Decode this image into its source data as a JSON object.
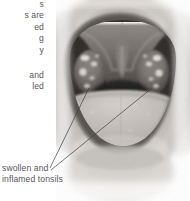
{
  "figure": {
    "style": "grayscale medical photograph illustration",
    "background_color": "#ffffff",
    "text_color": "#58585a",
    "leader_line_color": "#3f3f42"
  },
  "annotations": {
    "top_label": {
      "name": "upper-annotation-clipped",
      "lines": [
        "s",
        "s are",
        "ed",
        "g",
        "y"
      ],
      "text": "s\ns are\ned\ng\ny",
      "clipped": true,
      "align": "right"
    },
    "middle_label": {
      "name": "middle-annotation-clipped",
      "lines": [
        "and",
        "led"
      ],
      "text": "and\nled",
      "clipped": true,
      "align": "right"
    },
    "bottom_label": {
      "name": "tonsils-caption",
      "lines": [
        "swollen and",
        "inflamed tonsils"
      ],
      "text": "swollen and\ninflamed tonsils",
      "clipped": false,
      "align": "left"
    }
  },
  "anatomy": {
    "parts": [
      "upper lip",
      "upper teeth",
      "soft palate",
      "uvula",
      "left tonsil",
      "right tonsil",
      "oropharynx",
      "tongue",
      "lower lip"
    ]
  }
}
